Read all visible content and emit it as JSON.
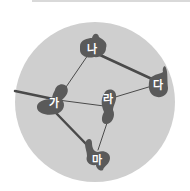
{
  "diagram": {
    "type": "network-graph",
    "background_circle": {
      "cx": 95,
      "cy": 102,
      "r": 80,
      "color": "#cfcfcf"
    },
    "node_color": "#5a5a5a",
    "edge_color": "#4a4a4a",
    "nodes": [
      {
        "id": "na",
        "label": "나",
        "x": 92,
        "y": 48
      },
      {
        "id": "da",
        "label": "다",
        "x": 158,
        "y": 85
      },
      {
        "id": "ga",
        "label": "가",
        "x": 54,
        "y": 103
      },
      {
        "id": "ra",
        "label": "라",
        "x": 106,
        "y": 100
      },
      {
        "id": "ma",
        "label": "마",
        "x": 97,
        "y": 158
      }
    ],
    "edges": [
      {
        "from": "na",
        "to": "da",
        "weight": "thick"
      },
      {
        "from": "na",
        "to": "ga",
        "weight": "thin"
      },
      {
        "from": "ga",
        "to": "ra",
        "weight": "thin"
      },
      {
        "from": "ra",
        "to": "da",
        "weight": "thin"
      },
      {
        "from": "ga",
        "to": "ma",
        "weight": "thick"
      },
      {
        "from": "ra",
        "to": "ma",
        "weight": "thin"
      },
      {
        "from": "external-left",
        "to": "ga",
        "weight": "thick"
      }
    ]
  }
}
